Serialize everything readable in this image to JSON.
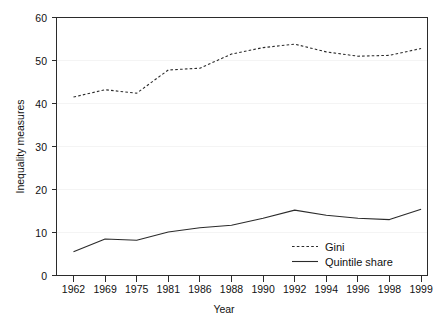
{
  "chart_data": {
    "type": "line",
    "title": "",
    "subtitle": "",
    "xlabel": "Year",
    "ylabel": "Inequality measures",
    "x": [
      1962,
      1969,
      1975,
      1981,
      1986,
      1988,
      1990,
      1992,
      1994,
      1996,
      1998,
      1999
    ],
    "categories": [
      "1962",
      "1969",
      "1975",
      "1981",
      "1986",
      "1988",
      "1990",
      "1992",
      "1994",
      "1996",
      "1998",
      "1999"
    ],
    "xtick_labels": [
      "1962",
      "1969",
      "1975",
      "1981",
      "1986",
      "1988",
      "1990",
      "1992",
      "1994",
      "1996",
      "1998",
      "1999"
    ],
    "ytick_labels": [
      "0",
      "10",
      "20",
      "30",
      "40",
      "50",
      "60"
    ],
    "yticks": [
      0,
      10,
      20,
      30,
      40,
      50,
      60
    ],
    "ylim": [
      0,
      60
    ],
    "xlim_index": [
      0,
      11
    ],
    "grid": true,
    "grid_axis": "y",
    "legend_position": "bottom-right",
    "series": [
      {
        "name": "Gini",
        "style": "dashed",
        "color": "#2b2b2b",
        "values": [
          41.5,
          43.2,
          42.4,
          47.8,
          48.2,
          51.5,
          53.0,
          53.8,
          52.0,
          51.0,
          51.2,
          52.8
        ]
      },
      {
        "name": "Quintile share",
        "style": "solid",
        "color": "#2b2b2b",
        "values": [
          5.5,
          8.5,
          8.2,
          10.1,
          11.1,
          11.7,
          13.3,
          15.2,
          14.0,
          13.3,
          13.0,
          15.4
        ]
      }
    ]
  },
  "axes": {
    "y_axis_title": "Inequality measures",
    "x_axis_title": "Year"
  },
  "legend": {
    "entries": [
      {
        "label": "Gini",
        "style": "dashed"
      },
      {
        "label": "Quintile share",
        "style": "solid"
      }
    ]
  },
  "ytick_text": {
    "t0": "0",
    "t1": "10",
    "t2": "20",
    "t3": "30",
    "t4": "40",
    "t5": "50",
    "t6": "60"
  },
  "xtick_text": {
    "t0": "1962",
    "t1": "1969",
    "t2": "1975",
    "t3": "1981",
    "t4": "1986",
    "t5": "1988",
    "t6": "1990",
    "t7": "1992",
    "t8": "1994",
    "t9": "1996",
    "t10": "1998",
    "t11": "1999"
  },
  "colors": {
    "background": "#ffffff",
    "axis": "#2b2b2b",
    "grid": "#f4f4f4",
    "series": "#2b2b2b"
  }
}
